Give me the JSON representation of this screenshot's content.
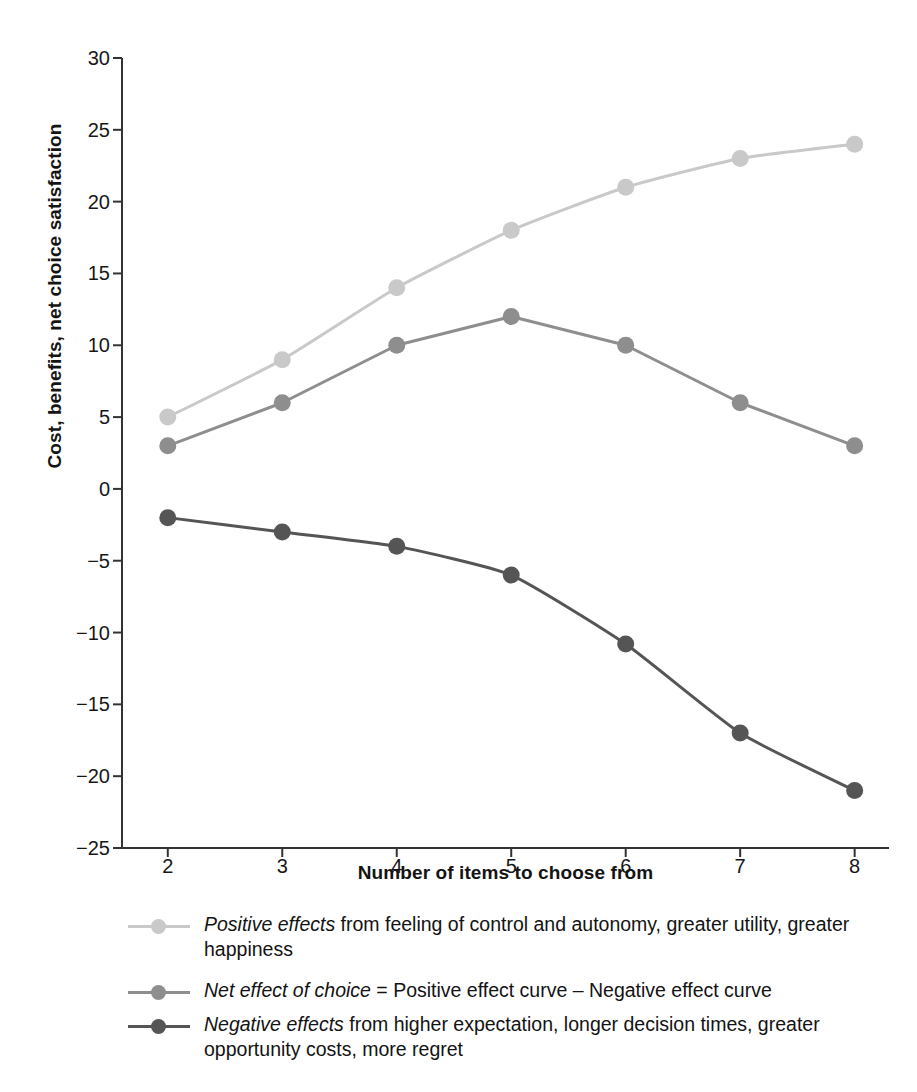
{
  "chart_data": {
    "type": "line",
    "title": "",
    "xlabel": "Number of items to choose from",
    "ylabel": "Cost, benefits, net choice satisfaction",
    "x": [
      2,
      3,
      4,
      5,
      6,
      7,
      8
    ],
    "xlim": [
      1.6,
      8.3
    ],
    "ylim": [
      -25,
      30
    ],
    "ytick_labels": [
      "30",
      "25",
      "20",
      "15",
      "10",
      "5",
      "0",
      "−5",
      "−10",
      "−15",
      "−20",
      "−25"
    ],
    "ytick_values": [
      30,
      25,
      20,
      15,
      10,
      5,
      0,
      -5,
      -10,
      -15,
      -20,
      -25
    ],
    "xtick_labels": [
      "2",
      "3",
      "4",
      "5",
      "6",
      "7",
      "8"
    ],
    "grid": false,
    "legend_position": "below",
    "series": [
      {
        "name": "Positive effects",
        "values": [
          5,
          9,
          14,
          18,
          21,
          23,
          24
        ],
        "color": "#c9c9c9"
      },
      {
        "name": "Net effect of choice",
        "values": [
          3,
          6,
          10,
          12,
          10,
          6,
          3
        ],
        "color": "#8e8e8e"
      },
      {
        "name": "Negative effects",
        "values": [
          -2,
          -3,
          -4,
          -6,
          -10.8,
          -17,
          -21
        ],
        "color": "#555555"
      }
    ]
  },
  "axes": {
    "y_title": "Cost, benefits, net choice satisfaction",
    "x_title": "Number of items to choose from"
  },
  "legend": {
    "entries": [
      {
        "marker_color": "#c9c9c9",
        "emphasis": "Positive effects",
        "rest": " from feeling of control and autonomy, greater utility, greater happiness"
      },
      {
        "marker_color": "#8e8e8e",
        "emphasis": "Net effect of choice",
        "rest": " = Positive effect curve – Negative effect curve"
      },
      {
        "marker_color": "#555555",
        "emphasis": "Negative effects",
        "rest": " from higher expectation, longer decision times, greater opportunity costs, more regret"
      }
    ]
  },
  "colors": {
    "positive": "#c9c9c9",
    "net": "#8e8e8e",
    "negative": "#555555",
    "axis": "#333333",
    "text": "#141414",
    "background": "#ffffff"
  }
}
